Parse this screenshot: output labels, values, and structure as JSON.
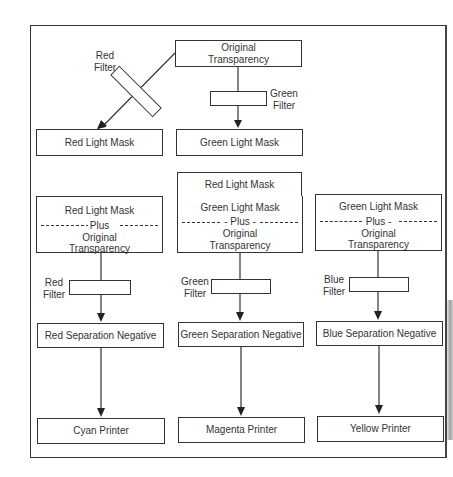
{
  "diagram": {
    "type": "flowchart",
    "title": "",
    "top_section": {
      "original": {
        "line1": "Original",
        "line2": "Transparency"
      },
      "red_filter": {
        "line1": "Red",
        "line2": "Filter"
      },
      "green_filter": {
        "line1": "Green",
        "line2": "Filter"
      },
      "red_light_mask": "Red Light Mask",
      "green_light_mask": "Green Light Mask"
    },
    "columns": [
      {
        "extra_top": null,
        "mask": "Red Light Mask",
        "plus": "Plus",
        "original_line1": "Original",
        "original_line2": "Transparency",
        "filter_line1": "Red",
        "filter_line2": "Filter",
        "negative": "Red Separation Negative",
        "printer": "Cyan Printer"
      },
      {
        "extra_top": "Red Light Mask",
        "mask": "Green Light Mask",
        "plus": "- Plus -",
        "original_line1": "Original",
        "original_line2": "Transparency",
        "filter_line1": "Green",
        "filter_line2": "Filter",
        "negative": "Green Separation Negative",
        "printer": "Magenta Printer"
      },
      {
        "extra_top": null,
        "mask": "Green Light Mask",
        "plus": "Plus -",
        "original_line1": "Original",
        "original_line2": "Transparency",
        "filter_line1": "Blue",
        "filter_line2": "Filter",
        "negative": "Blue Separation Negative",
        "printer": "Yellow Printer"
      }
    ],
    "edges": [
      {
        "from": "Original Transparency",
        "to": "Red Light Mask",
        "via": "Red Filter"
      },
      {
        "from": "Original Transparency",
        "to": "Green Light Mask",
        "via": "Green Filter"
      },
      {
        "from": "Red Light Mask + Original Transparency",
        "to": "Red Separation Negative",
        "via": "Red Filter"
      },
      {
        "from": "Red Light Mask / Green Light Mask + Original Transparency",
        "to": "Green Separation Negative",
        "via": "Green Filter"
      },
      {
        "from": "Green Light Mask + Original Transparency",
        "to": "Blue Separation Negative",
        "via": "Blue Filter"
      },
      {
        "from": "Red Separation Negative",
        "to": "Cyan Printer"
      },
      {
        "from": "Green Separation Negative",
        "to": "Magenta Printer"
      },
      {
        "from": "Blue Separation Negative",
        "to": "Yellow Printer"
      }
    ],
    "colors": {
      "line": "#333333",
      "background": "#ffffff"
    }
  }
}
